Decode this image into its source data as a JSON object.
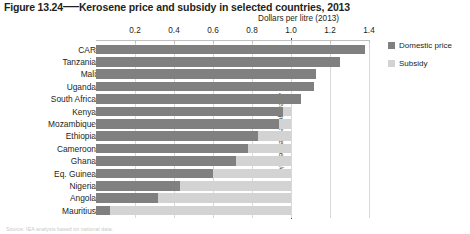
{
  "figure": {
    "number": "Figure 13.24",
    "dash": "—",
    "title": "Kerosene price and subsidy in selected countries, 2013",
    "source_note": "Source: IEA analysis based on national data."
  },
  "legend": {
    "position": "right",
    "items": [
      {
        "label": "Domestic price",
        "color": "#808080",
        "key": "domestic"
      },
      {
        "label": "Subsidy",
        "color": "#d3d3d3",
        "key": "subsidy"
      }
    ]
  },
  "annotations": {
    "reference_line_label": "Average reference price",
    "reference_line_value": 1.0
  },
  "chart_data": {
    "type": "bar",
    "orientation": "horizontal",
    "stacked": true,
    "title": "Kerosene price and subsidy in selected countries, 2013",
    "xlabel": "Dollars per litre (2013)",
    "ylabel": "",
    "xlim": [
      0,
      1.4
    ],
    "xticks": [
      0.2,
      0.4,
      0.6,
      0.8,
      1.0,
      1.2,
      1.4
    ],
    "xticklabels": [
      "0.2",
      "0.4",
      "0.6",
      "0.8",
      "1.0",
      "1.2",
      "1.4"
    ],
    "grid": true,
    "legend_position": "right",
    "reference_line": 1.0,
    "reference_line_label": "Average reference price",
    "categories": [
      "CAR",
      "Tanzania",
      "Mali",
      "Uganda",
      "South Africa",
      "Kenya",
      "Mozambique",
      "Ethiopia",
      "Cameroon",
      "Ghana",
      "Eq. Guinea",
      "Nigeria",
      "Angola",
      "Mauritius"
    ],
    "series": [
      {
        "name": "Domestic price",
        "color": "#808080",
        "values": [
          1.38,
          1.25,
          1.13,
          1.12,
          1.05,
          0.96,
          0.94,
          0.83,
          0.78,
          0.72,
          0.6,
          0.43,
          0.32,
          0.07
        ]
      },
      {
        "name": "Subsidy",
        "color": "#d3d3d3",
        "values": [
          0.0,
          0.0,
          0.0,
          0.0,
          0.0,
          0.04,
          0.06,
          0.17,
          0.22,
          0.28,
          0.4,
          0.57,
          0.68,
          0.93
        ]
      }
    ],
    "units": "USD per litre (2013)"
  }
}
